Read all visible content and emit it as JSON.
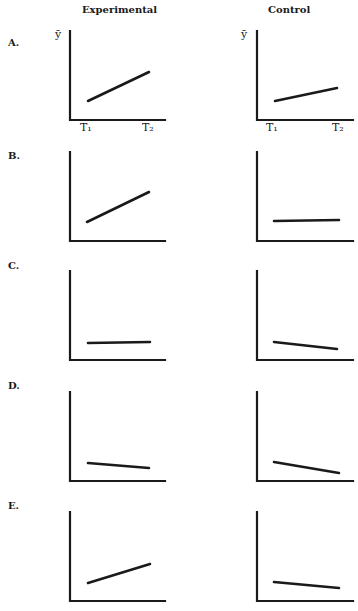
{
  "columns": [
    {
      "title": "Experimental"
    },
    {
      "title": "Control"
    }
  ],
  "axis": {
    "y_label": "ȳ",
    "x_ticks": [
      "T₁",
      "T₂"
    ]
  },
  "colors": {
    "ink": "#1a1a1a",
    "background": "#ffffff"
  },
  "rows": [
    {
      "label": "A.",
      "offset": 0,
      "experimental": {
        "x1": 88,
        "y1": 101,
        "x2": 149,
        "y2": 72
      },
      "control": {
        "x1": 275,
        "y1": 101,
        "x2": 337,
        "y2": 88
      }
    },
    {
      "label": "B.",
      "offset": 121,
      "experimental": {
        "x1": 87,
        "y1": 222,
        "x2": 149,
        "y2": 192
      },
      "control": {
        "x1": 274,
        "y1": 221,
        "x2": 339,
        "y2": 220
      }
    },
    {
      "label": "C.",
      "offset": 240,
      "experimental": {
        "x1": 88,
        "y1": 343,
        "x2": 150,
        "y2": 342
      },
      "control": {
        "x1": 274,
        "y1": 342,
        "x2": 337,
        "y2": 349
      }
    },
    {
      "label": "D.",
      "offset": 361,
      "experimental": {
        "x1": 88,
        "y1": 463,
        "x2": 149,
        "y2": 468
      },
      "control": {
        "x1": 274,
        "y1": 462,
        "x2": 339,
        "y2": 473
      }
    },
    {
      "label": "E.",
      "offset": 481,
      "experimental": {
        "x1": 88,
        "y1": 583,
        "x2": 150,
        "y2": 564
      },
      "control": {
        "x1": 274,
        "y1": 582,
        "x2": 339,
        "y2": 588
      }
    }
  ],
  "chart_data": [
    {
      "type": "line",
      "panel": "A-Experimental",
      "x": [
        "T1",
        "T2"
      ],
      "values": [
        1,
        2.0
      ],
      "description": "increase"
    },
    {
      "type": "line",
      "panel": "A-Control",
      "x": [
        "T1",
        "T2"
      ],
      "values": [
        1,
        1.45
      ],
      "description": "smaller increase"
    },
    {
      "type": "line",
      "panel": "B-Experimental",
      "x": [
        "T1",
        "T2"
      ],
      "values": [
        1,
        2.0
      ],
      "description": "increase"
    },
    {
      "type": "line",
      "panel": "B-Control",
      "x": [
        "T1",
        "T2"
      ],
      "values": [
        1,
        1.0
      ],
      "description": "no change"
    },
    {
      "type": "line",
      "panel": "C-Experimental",
      "x": [
        "T1",
        "T2"
      ],
      "values": [
        1,
        1.0
      ],
      "description": "no change"
    },
    {
      "type": "line",
      "panel": "C-Control",
      "x": [
        "T1",
        "T2"
      ],
      "values": [
        1,
        0.6
      ],
      "description": "decrease"
    },
    {
      "type": "line",
      "panel": "D-Experimental",
      "x": [
        "T1",
        "T2"
      ],
      "values": [
        1,
        0.75
      ],
      "description": "slight decrease"
    },
    {
      "type": "line",
      "panel": "D-Control",
      "x": [
        "T1",
        "T2"
      ],
      "values": [
        1,
        0.45
      ],
      "description": "larger decrease"
    },
    {
      "type": "line",
      "panel": "E-Experimental",
      "x": [
        "T1",
        "T2"
      ],
      "values": [
        1,
        2.0
      ],
      "description": "increase"
    },
    {
      "type": "line",
      "panel": "E-Control",
      "x": [
        "T1",
        "T2"
      ],
      "values": [
        1,
        0.7
      ],
      "description": "decrease"
    }
  ]
}
